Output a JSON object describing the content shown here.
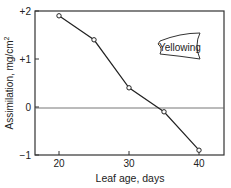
{
  "chart_data": {
    "type": "line",
    "title": "",
    "xlabel": "Leaf age, days",
    "ylabel": "Assimilation, mg/cm²",
    "ylabel_main": "Assimilation,  mg/cm",
    "ylabel_sup": "2",
    "x": [
      20,
      25,
      30,
      35,
      40
    ],
    "series": [
      {
        "name": "Assimilation",
        "values": [
          1.9,
          1.4,
          0.4,
          -0.1,
          -0.9
        ]
      }
    ],
    "xlim": [
      16.5,
      43.5
    ],
    "ylim": [
      -1,
      2
    ],
    "xticks": [
      20,
      30,
      40
    ],
    "xtick_labels": [
      "20",
      "30",
      "40"
    ],
    "yticks": [
      2,
      1,
      0,
      -1
    ],
    "ytick_labels": [
      "+2",
      "+1",
      "0",
      "−1"
    ],
    "grid": false,
    "zero_line": true,
    "annotations": [
      {
        "text": "Yellowing",
        "x": 36,
        "y": 1.15
      }
    ],
    "legend": null
  }
}
